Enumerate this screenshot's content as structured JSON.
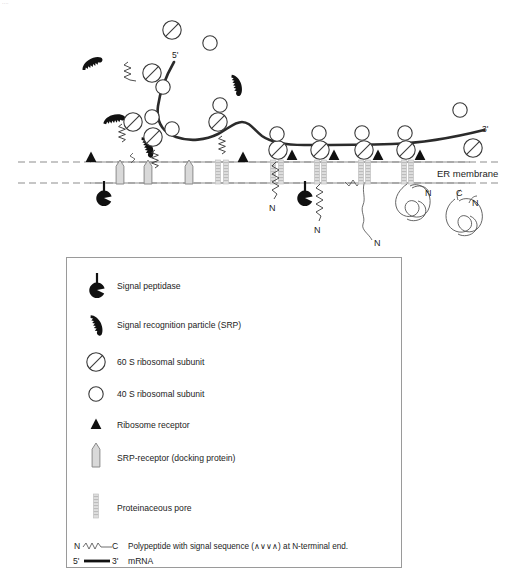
{
  "figure": {
    "clipped_header_text": "....",
    "membrane_label": "ER membrane",
    "mrna_five_prime": "5'",
    "mrna_three_prime": "3'",
    "terminus_labels": {
      "n": "N",
      "c": "C"
    },
    "nascent_chain_n_labels": [
      "N",
      "N",
      "N",
      "N"
    ],
    "folded_protein_labels": [
      "N",
      "C",
      "N"
    ]
  },
  "legend": {
    "items": [
      {
        "icon": "signal-peptidase-icon",
        "label": "Signal peptidase"
      },
      {
        "icon": "srp-icon",
        "label": "Signal recognition particle (SRP)"
      },
      {
        "icon": "60s-ribosomal-subunit-icon",
        "label": "60 S ribosomal subunit"
      },
      {
        "icon": "40s-ribosomal-subunit-icon",
        "label": "40 S ribosomal subunit"
      },
      {
        "icon": "ribosome-receptor-icon",
        "label": "Ribosome receptor"
      },
      {
        "icon": "srp-receptor-icon",
        "label": "SRP-receptor (docking protein)"
      },
      {
        "icon": "proteinaceous-pore-icon",
        "label": "Proteinaceous pore"
      }
    ],
    "polypeptide_row": {
      "n_label": "N",
      "c_label": "C",
      "description": "Polypeptide with signal sequence (∧∨∨∧) at N-terminal end."
    },
    "mrna_row": {
      "five_prime": "5'",
      "three_prime": "3'",
      "label": "mRNA"
    }
  },
  "colors": {
    "ink": "#1a1a1a",
    "membrane": "#8d8d8d",
    "mrna": "#2b2b2b",
    "docking_fill": "#d9d9d9",
    "pore_fill": "#dcdcdc",
    "solid_black": "#111111",
    "legend_border": "#9a9a9a",
    "background": "#ffffff"
  }
}
